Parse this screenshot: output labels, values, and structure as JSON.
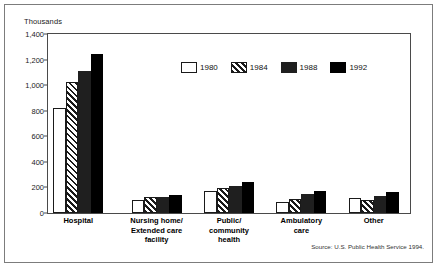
{
  "chart_data": {
    "type": "bar",
    "title": "",
    "subtitle": "",
    "unit_label": "Thousands",
    "xlabel": "",
    "ylabel": "",
    "ylim": [
      0,
      1400
    ],
    "yticks": [
      "0",
      "200",
      "400",
      "600",
      "800",
      "1,000",
      "1,200",
      "1,400"
    ],
    "ytick_values": [
      0,
      200,
      400,
      600,
      800,
      1000,
      1200,
      1400
    ],
    "grid": false,
    "legend_position": "top-center",
    "categories": [
      "Hospital",
      "Nursing home/\nExtended care\nfacility",
      "Public/\ncommunity\nhealth",
      "Ambulatory\ncare",
      "Other"
    ],
    "series": [
      {
        "name": "1980",
        "fill": "white-outline",
        "color": "#ffffff",
        "values": [
          820,
          100,
          175,
          85,
          120
        ]
      },
      {
        "name": "1984",
        "fill": "diagonal-hatch",
        "color": "#1a1a1a",
        "values": [
          1025,
          125,
          195,
          110,
          105
        ]
      },
      {
        "name": "1988",
        "fill": "solid-dark",
        "color": "#1f1f1f",
        "values": [
          1110,
          125,
          215,
          145,
          130
        ]
      },
      {
        "name": "1992",
        "fill": "solid-black",
        "color": "#000000",
        "values": [
          1240,
          140,
          245,
          170,
          165
        ]
      }
    ],
    "source": "Source: U.S. Public Health Service 1994."
  },
  "legend": {
    "items": [
      {
        "label": "1980"
      },
      {
        "label": "1984"
      },
      {
        "label": "1988"
      },
      {
        "label": "1992"
      }
    ]
  }
}
